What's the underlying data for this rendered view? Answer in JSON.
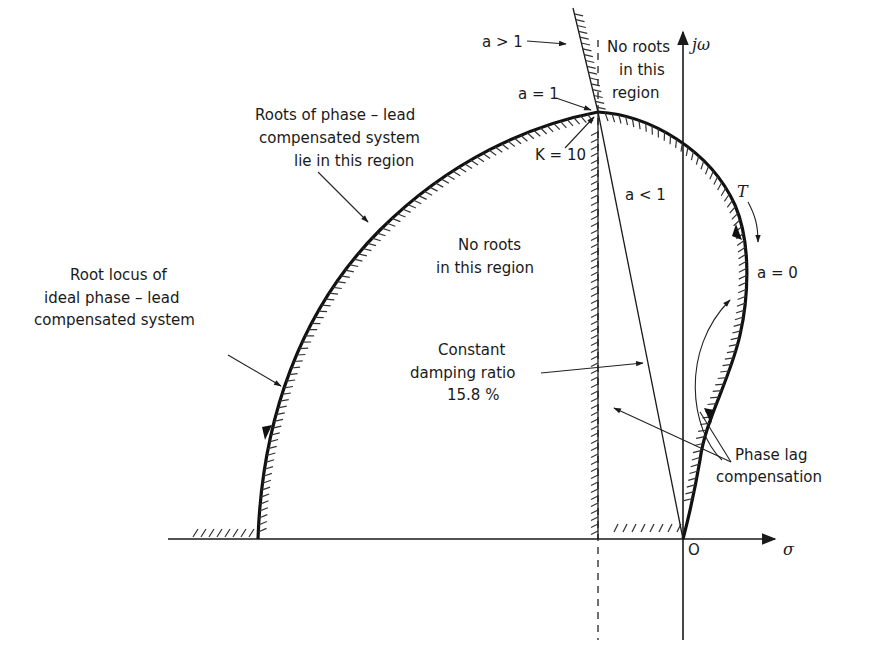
{
  "diagram": {
    "type": "root-locus-sketch",
    "axes": {
      "imag_axis_label": "jω",
      "real_axis_label": "σ",
      "origin_label": "O"
    },
    "labels": {
      "a_gt_1": "a > 1",
      "no_roots_top": [
        "No roots",
        "in this",
        "region"
      ],
      "a_eq_1": "a = 1",
      "k_eq_10": "K = 10",
      "roots_phase_lead": [
        "Roots of phase – lead",
        "compensated system",
        "lie in this region"
      ],
      "a_lt_1": "a < 1",
      "t_label": "T",
      "a_eq_0": "a = 0",
      "no_roots_center": [
        "No roots",
        "in this region"
      ],
      "root_locus_ideal": [
        "Root locus of",
        "ideal phase – lead",
        "compensated system"
      ],
      "constant_damping": [
        "Constant",
        "damping ratio",
        "15.8 %"
      ],
      "phase_lag": [
        "Phase lag",
        "compensation"
      ]
    },
    "values": {
      "damping_ratio_percent": 15.8,
      "gain_K": 10
    },
    "colors": {
      "ink": "#1a1a1a",
      "background": "#ffffff"
    }
  }
}
